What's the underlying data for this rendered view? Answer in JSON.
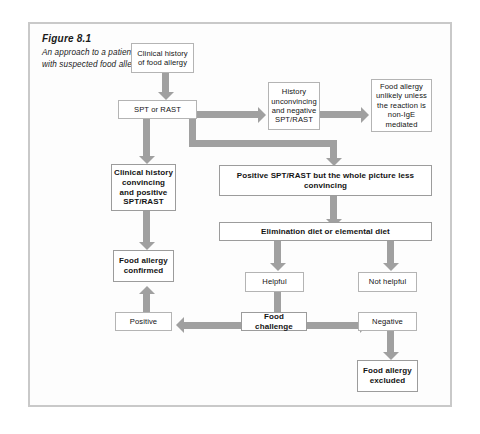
{
  "figure": {
    "caption_title": "Figure 8.1",
    "caption_text": "An approach to a patient with suspected food allergy."
  },
  "colors": {
    "arrow": "#a0a0a0",
    "box_border": "#b4b4b4",
    "frame_border": "#c9c9c9",
    "background": "#fdfdfd",
    "text": "#131313"
  },
  "nodes": {
    "clinical_history": "Clinical history of food allergy",
    "spt_or_rast": "SPT or RAST",
    "history_unconvincing": "History unconvincing and negative SPT/RAST",
    "food_allergy_unlikely": "Food allergy unlikely unless the reaction is non-IgE mediated",
    "clinical_history_convincing": "Clinical history convincing and positive SPT/RAST",
    "positive_less_convincing": "Positive SPT/RAST but the whole picture less convincing",
    "food_allergy_confirmed": "Food allergy confirmed",
    "elimination_diet": "Elimination diet or elemental diet",
    "helpful": "Helpful",
    "not_helpful": "Not helpful",
    "positive": "Positive",
    "food_challenge": "Food challenge",
    "negative": "Negative",
    "food_allergy_excluded": "Food allergy excluded"
  }
}
